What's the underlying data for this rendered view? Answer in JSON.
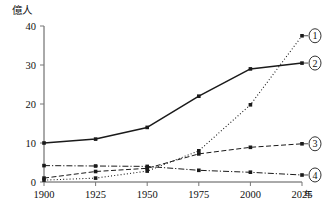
{
  "chart_data": {
    "type": "line",
    "title": "",
    "xlabel": "年",
    "ylabel": "億人",
    "x": [
      1900,
      1925,
      1950,
      1975,
      2000,
      2025
    ],
    "xtick_labels": [
      "1900",
      "1925",
      "1950",
      "1975",
      "2000",
      "2025"
    ],
    "ytick_labels": [
      "0",
      "10",
      "20",
      "30",
      "40"
    ],
    "ytick_values": [
      0,
      10,
      20,
      30,
      40
    ],
    "xlim": [
      1900,
      2025
    ],
    "ylim": [
      0,
      40
    ],
    "grid": false,
    "legend_position": "right-end-of-lines",
    "series": [
      {
        "name": "①",
        "label": "1",
        "linestyle": "dotted",
        "marker": "dot",
        "values": [
          0.5,
          1.0,
          2.8,
          8.0,
          19.8,
          37.5
        ]
      },
      {
        "name": "②",
        "label": "2",
        "linestyle": "solid",
        "marker": "dot",
        "values": [
          10.0,
          11.0,
          14.0,
          22.0,
          29.0,
          30.5
        ]
      },
      {
        "name": "③",
        "label": "3",
        "linestyle": "dashed",
        "marker": "dot",
        "values": [
          1.0,
          2.7,
          3.5,
          7.2,
          8.9,
          9.8
        ]
      },
      {
        "name": "④",
        "label": "4",
        "linestyle": "dash-dot",
        "marker": "dot",
        "values": [
          4.2,
          4.1,
          4.0,
          3.0,
          2.5,
          1.8
        ]
      }
    ]
  },
  "axes": {
    "y_unit": "億人",
    "x_unit": "年"
  },
  "colors": {
    "line": "#1a1a1a",
    "axis": "#555555",
    "tick": "#777777",
    "background": "#ffffff",
    "text": "#111111"
  }
}
